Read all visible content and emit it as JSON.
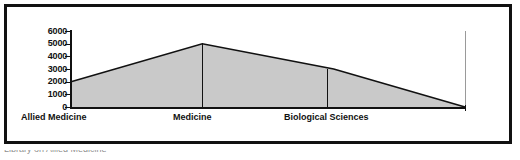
{
  "figure": {
    "caption_cutoff": "Library on Allied Medicine"
  },
  "chart_data": {
    "type": "area",
    "title": "",
    "subtitle": "",
    "xlabel": "",
    "ylabel": "",
    "grid": false,
    "legend": "none",
    "fill_color": "#c9c9c9",
    "line_color": "#111111",
    "axis_color": "#111111",
    "categories": [
      "Allied Medicine",
      "Medicine",
      "Biological Sciences",
      ""
    ],
    "x": [
      0,
      1,
      2,
      3
    ],
    "values": [
      2000,
      5000,
      3000,
      0
    ],
    "series": [
      {
        "name": "Subject holdings",
        "values": [
          2000,
          5000,
          3000,
          0
        ]
      }
    ],
    "ylim": [
      0,
      6000
    ],
    "yticks": [
      0,
      1000,
      2000,
      3000,
      4000,
      5000,
      6000
    ],
    "ytick_labels": [
      "0",
      "1000",
      "2000",
      "3000",
      "4000",
      "5000",
      "6000"
    ],
    "xtick_labels": [
      "Allied Medicine",
      "Medicine",
      "Biological Sciences"
    ]
  }
}
